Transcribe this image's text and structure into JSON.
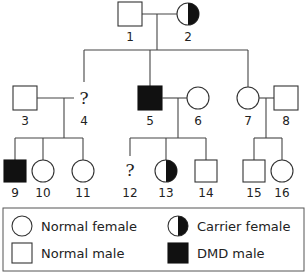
{
  "pedigree": {
    "title": "DMD pedigree",
    "individuals": [
      {
        "id": "1",
        "label": "1",
        "sex": "male",
        "status": "normal",
        "generation": "I"
      },
      {
        "id": "2",
        "label": "2",
        "sex": "female",
        "status": "carrier",
        "generation": "I"
      },
      {
        "id": "3",
        "label": "3",
        "sex": "male",
        "status": "normal",
        "generation": "II"
      },
      {
        "id": "4",
        "label": "4",
        "sex": "unknown",
        "status": "unknown",
        "symbol": "?",
        "generation": "II"
      },
      {
        "id": "5",
        "label": "5",
        "sex": "male",
        "status": "affected",
        "generation": "II"
      },
      {
        "id": "6",
        "label": "6",
        "sex": "female",
        "status": "normal",
        "generation": "II"
      },
      {
        "id": "7",
        "label": "7",
        "sex": "female",
        "status": "normal",
        "generation": "II"
      },
      {
        "id": "8",
        "label": "8",
        "sex": "male",
        "status": "normal",
        "generation": "II"
      },
      {
        "id": "9",
        "label": "9",
        "sex": "male",
        "status": "affected",
        "generation": "III"
      },
      {
        "id": "10",
        "label": "10",
        "sex": "female",
        "status": "normal",
        "generation": "III"
      },
      {
        "id": "11",
        "label": "11",
        "sex": "female",
        "status": "normal",
        "generation": "III"
      },
      {
        "id": "12",
        "label": "12",
        "sex": "unknown",
        "status": "unknown",
        "symbol": "?",
        "generation": "III"
      },
      {
        "id": "13",
        "label": "13",
        "sex": "female",
        "status": "carrier",
        "generation": "III"
      },
      {
        "id": "14",
        "label": "14",
        "sex": "male",
        "status": "normal",
        "generation": "III"
      },
      {
        "id": "15",
        "label": "15",
        "sex": "male",
        "status": "normal",
        "generation": "III"
      },
      {
        "id": "16",
        "label": "16",
        "sex": "female",
        "status": "normal",
        "generation": "III"
      }
    ],
    "unknown_symbol": "?",
    "matings": [
      {
        "partners": [
          "1",
          "2"
        ],
        "children": [
          "4",
          "5",
          "7"
        ]
      },
      {
        "partners": [
          "3",
          "4"
        ],
        "children": [
          "9",
          "10",
          "11"
        ]
      },
      {
        "partners": [
          "5",
          "6"
        ],
        "children": [
          "12",
          "13",
          "14"
        ]
      },
      {
        "partners": [
          "7",
          "8"
        ],
        "children": [
          "15",
          "16"
        ]
      }
    ]
  },
  "legend": {
    "items": [
      {
        "symbol": "circle-open",
        "label": "Normal female"
      },
      {
        "symbol": "circle-half",
        "label": "Carrier female"
      },
      {
        "symbol": "square-open",
        "label": "Normal male"
      },
      {
        "symbol": "square-filled",
        "label": "DMD male"
      }
    ]
  },
  "colors": {
    "line": "#444444",
    "affected": "#111111",
    "background": "#ffffff"
  }
}
